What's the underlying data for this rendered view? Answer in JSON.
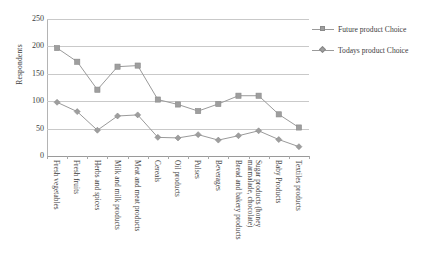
{
  "chart_data": {
    "type": "line",
    "title": "",
    "xlabel": "",
    "ylabel": "Respondents",
    "ylim": [
      0,
      250
    ],
    "yticks": [
      0,
      50,
      100,
      150,
      200,
      250
    ],
    "grid": true,
    "legend_position": "right",
    "categories": [
      "Fresh vegetables",
      "Fresh fruits",
      "Herbs and spices",
      "Milk and milk products",
      "Meat and meat products",
      "Cereals",
      "Oil products",
      "Pulses",
      "Beverages",
      "Bread and bakery products",
      "Sugar products (honey\nmarmalade, chocolate)",
      "Baby Products",
      "Textiles products"
    ],
    "series": [
      {
        "name": "Future product Choice",
        "marker": "square",
        "color": "#9e9e9e",
        "values": [
          197,
          172,
          121,
          163,
          165,
          103,
          94,
          82,
          95,
          110,
          110,
          76,
          52
        ]
      },
      {
        "name": "Todays product Choice",
        "marker": "diamond",
        "color": "#9e9e9e",
        "values": [
          98,
          81,
          47,
          73,
          75,
          34,
          33,
          39,
          29,
          37,
          46,
          30,
          17
        ]
      }
    ]
  },
  "legend": {
    "items": [
      {
        "label": "Future product Choice",
        "marker": "square"
      },
      {
        "label": "Todays product Choice",
        "marker": "diamond"
      }
    ]
  },
  "axis": {
    "y_title": "Respondents"
  }
}
